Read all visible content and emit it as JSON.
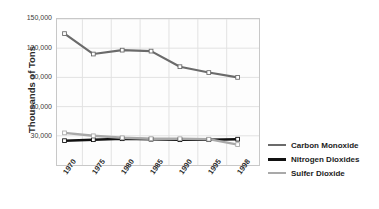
{
  "chart_data": {
    "type": "line",
    "title": "",
    "xlabel": "",
    "ylabel": "Thousands of Tons",
    "categories": [
      "1970",
      "1975",
      "1980",
      "1985",
      "1990",
      "1995",
      "1998"
    ],
    "xtick_labels": [
      "1970",
      "1975",
      "1980",
      "1985",
      "1990",
      "1995",
      "1998"
    ],
    "ytick_labels": [
      "150,000",
      "120,000",
      "90,000",
      "60,000",
      "30,000"
    ],
    "ytick_values": [
      150000,
      120000,
      90000,
      60000,
      30000
    ],
    "ylim": [
      0,
      150000
    ],
    "grid": true,
    "legend_position": "right",
    "series": [
      {
        "name": "Carbon Monoxide",
        "color": "#6b6b6b",
        "width": 2.2,
        "markers": true,
        "values": [
          135000,
          114000,
          118000,
          117000,
          101000,
          95000,
          90000
        ]
      },
      {
        "name": "Nitrogen Dioxides",
        "color": "#111111",
        "width": 2.6,
        "markers": true,
        "values": [
          25000,
          26000,
          27000,
          26500,
          26000,
          26000,
          26500
        ]
      },
      {
        "name": "Sulfer Dioxide",
        "color": "#a9a9a9",
        "width": 2.4,
        "markers": true,
        "values": [
          33000,
          30000,
          28000,
          27000,
          27000,
          26500,
          21000
        ]
      }
    ]
  },
  "legend": {
    "items": [
      {
        "label": "Carbon Monoxide",
        "color": "#6b6b6b",
        "thickness": 2
      },
      {
        "label": "Nitrogen Dioxides",
        "color": "#111111",
        "thickness": 3
      },
      {
        "label": "Sulfer Dioxide",
        "color": "#a9a9a9",
        "thickness": 2.5
      }
    ]
  },
  "style": {
    "plot_background": "#fdfdfd",
    "grid_color": "#e2e2e2",
    "border_color": "#c8c8c8",
    "text_color": "#2b2b2b"
  }
}
